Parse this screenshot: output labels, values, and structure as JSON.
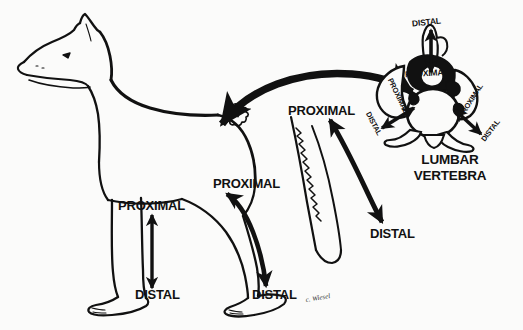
{
  "diagram": {
    "background_color": "#fbfbfa",
    "ink_color": "#111111",
    "caption": {
      "line1": "LUMBAR",
      "line2": "VERTEBRA"
    },
    "signature": "c. Wiesel"
  },
  "labels": {
    "foreleg_proximal": "PROXIMAL",
    "foreleg_distal": "DISTAL",
    "hindleg_proximal": "PROXIMAL",
    "hindleg_distal": "DISTAL",
    "tail_proximal": "PROXIMAL",
    "tail_distal": "DISTAL",
    "vertebra_top_distal": "DISTAL",
    "vertebra_top_proximal": "PROXIMAL",
    "vertebra_left_proximal": "PROXIMAL",
    "vertebra_left_distal": "DISTAL",
    "vertebra_right_proximal": "PROXIMAL",
    "vertebra_right_distal": "DISTAL"
  },
  "figure_parts": {
    "dog_outline": "dog-body-outline",
    "dog_head": "dog-head",
    "dog_ear": "dog-ear",
    "dog_eye": "dog-eye",
    "dog_mouth": "dog-mouth",
    "foreleg": "dog-foreleg",
    "hindleg": "dog-hindleg",
    "tail": "dog-tail",
    "small_vertebra": "small-vertebra-on-back",
    "enlarged_vertebra": "enlarged-lumbar-vertebra",
    "magnify_arrow": "magnification-arrow"
  },
  "arrows": {
    "foreleg_axis": "double-headed-vertical-arrow",
    "hindleg_axis": "double-headed-curved-arrow",
    "tail_axis": "double-headed-curved-arrow",
    "vertebra_vertical": "double-headed-vertical-arrow",
    "vertebra_left_diagonal": "double-headed-diagonal-arrow",
    "vertebra_right_diagonal": "double-headed-diagonal-arrow"
  }
}
